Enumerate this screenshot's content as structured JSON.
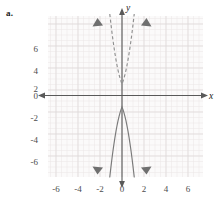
{
  "part_label": "a.",
  "figure": {
    "axis_labels": {
      "x": "x",
      "y": "y"
    },
    "x_tick_labels": [
      "-6",
      "-4",
      "-2",
      "0",
      "2",
      "4",
      "6"
    ],
    "y_tick_labels": [
      "6",
      "4",
      "2",
      "0",
      "-2",
      "-4",
      "-6"
    ],
    "colors": {
      "grid_minor": "#ebe7e7",
      "grid_major": "#ddd8d8",
      "axis": "#595959",
      "curve_solid": "#7a7a7a",
      "curve_dashed": "#8f8f8f",
      "text": "#4d4d4d",
      "label": "#1a1a1a",
      "plot_background": "#fbfafa"
    }
  },
  "chart_data": {
    "type": "line",
    "title": "",
    "xlabel": "x",
    "ylabel": "y",
    "xlim": [
      -7,
      7
    ],
    "ylim": [
      -7.3,
      7.3
    ],
    "grid": true,
    "minor_grid_step": 0.5,
    "major_grid_step": 2,
    "x_ticks": [
      -6,
      -4,
      -2,
      0,
      2,
      4,
      6
    ],
    "y_ticks": [
      6,
      4,
      2,
      0,
      -2,
      -4,
      -6
    ],
    "legend": "none",
    "annotations": [
      "both curves pass through the origin (0, 0)",
      "dashed parabola opens upward with arrowheads at top ends",
      "solid parabola opens downward with arrowheads at bottom ends"
    ],
    "series": [
      {
        "name": "dashed upward parabola",
        "style": "dashed",
        "equation": "y = 1.5x^2",
        "coefficient": 1.5,
        "x": [
          -2.22,
          -2.0,
          -1.75,
          -1.5,
          -1.25,
          -1.0,
          -0.75,
          -0.5,
          -0.25,
          0,
          0.25,
          0.5,
          0.75,
          1.0,
          1.25,
          1.5,
          1.75,
          2.0,
          2.22
        ],
        "values": [
          7.4,
          6.0,
          4.59,
          3.38,
          2.34,
          1.5,
          0.84,
          0.38,
          0.09,
          0,
          0.09,
          0.38,
          0.84,
          1.5,
          2.34,
          3.38,
          4.59,
          6.0,
          7.4
        ]
      },
      {
        "name": "solid downward parabola",
        "style": "solid",
        "equation": "y = -1.5x^2",
        "coefficient": -1.5,
        "x": [
          -2.22,
          -2.0,
          -1.75,
          -1.5,
          -1.25,
          -1.0,
          -0.75,
          -0.5,
          -0.25,
          0,
          0.25,
          0.5,
          0.75,
          1.0,
          1.25,
          1.5,
          1.75,
          2.0,
          2.22
        ],
        "values": [
          -7.4,
          -6.0,
          -4.59,
          -3.38,
          -2.34,
          -1.5,
          -0.84,
          -0.38,
          -0.09,
          0,
          -0.09,
          -0.38,
          -0.84,
          -1.5,
          -2.34,
          -3.38,
          -4.59,
          -6.0,
          -7.4
        ]
      }
    ]
  }
}
